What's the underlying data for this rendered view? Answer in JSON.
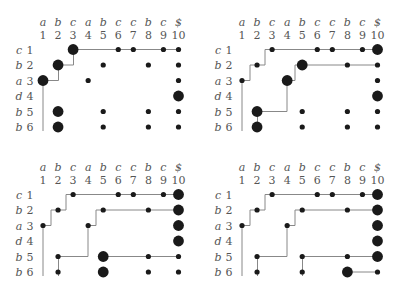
{
  "columns": {
    "letters": [
      "a",
      "b",
      "c",
      "a",
      "b",
      "c",
      "c",
      "b",
      "c",
      "$"
    ],
    "numbers": [
      "1",
      "2",
      "3",
      "4",
      "5",
      "6",
      "7",
      "8",
      "9",
      "10"
    ]
  },
  "rows": {
    "letters": [
      "c",
      "b",
      "a",
      "d",
      "b",
      "b"
    ],
    "numbers": [
      "1",
      "2",
      "3",
      "4",
      "5",
      "6"
    ]
  },
  "panels": [
    {
      "id": "top-left",
      "origin": [
        0,
        0
      ],
      "small_dots": [
        [
          1,
          6
        ],
        [
          1,
          7
        ],
        [
          1,
          9
        ],
        [
          1,
          10
        ],
        [
          2,
          5
        ],
        [
          2,
          8
        ],
        [
          2,
          10
        ],
        [
          3,
          4
        ],
        [
          3,
          10
        ],
        [
          5,
          5
        ],
        [
          5,
          8
        ],
        [
          5,
          10
        ],
        [
          6,
          5
        ],
        [
          6,
          8
        ],
        [
          6,
          10
        ]
      ],
      "large_dots": [
        [
          1,
          3
        ],
        [
          2,
          2
        ],
        [
          3,
          1
        ],
        [
          4,
          10
        ],
        [
          5,
          2
        ],
        [
          6,
          2
        ]
      ],
      "paths": [
        [
          [
            6.3,
            1
          ],
          [
            3,
            1
          ],
          [
            3,
            1.5
          ],
          [
            2.5,
            1.5
          ],
          [
            2.5,
            2
          ],
          [
            2,
            2
          ],
          [
            2,
            2.5
          ],
          [
            1.5,
            2.5
          ],
          [
            1.5,
            3
          ],
          [
            1,
            3
          ]
        ],
        [
          [
            1,
            3
          ],
          [
            1,
            10
          ]
        ]
      ]
    },
    {
      "id": "top-right",
      "origin": [
        199,
        0
      ],
      "small_dots": [
        [
          1,
          3
        ],
        [
          1,
          6
        ],
        [
          1,
          7
        ],
        [
          1,
          9
        ],
        [
          2,
          2
        ],
        [
          2,
          8
        ],
        [
          2,
          10
        ],
        [
          3,
          1
        ],
        [
          3,
          10
        ],
        [
          5,
          5
        ],
        [
          5,
          8
        ],
        [
          5,
          10
        ],
        [
          6,
          5
        ],
        [
          6,
          8
        ],
        [
          6,
          10
        ]
      ],
      "large_dots": [
        [
          1,
          10
        ],
        [
          2,
          5
        ],
        [
          3,
          4
        ],
        [
          4,
          10
        ],
        [
          5,
          2
        ],
        [
          6,
          2
        ]
      ],
      "paths": [
        [
          [
            6.3,
            1
          ],
          [
            3,
            1
          ],
          [
            3,
            1.5
          ],
          [
            2.5,
            1.5
          ],
          [
            2.5,
            2
          ],
          [
            2,
            2
          ],
          [
            2,
            2.5
          ],
          [
            1.5,
            2.5
          ],
          [
            1.5,
            3
          ],
          [
            1,
            3
          ]
        ],
        [
          [
            1,
            3
          ],
          [
            1,
            10
          ]
        ],
        [
          [
            2,
            10
          ],
          [
            2,
            5
          ],
          [
            2.5,
            5
          ],
          [
            2.5,
            4.5
          ],
          [
            3,
            4.5
          ],
          [
            3,
            4
          ],
          [
            3,
            4
          ],
          [
            5,
            4
          ],
          [
            5,
            2
          ]
        ],
        [
          [
            5,
            2
          ],
          [
            6,
            2
          ]
        ]
      ]
    },
    {
      "id": "bottom-left",
      "origin": [
        0,
        145
      ],
      "small_dots": [
        [
          1,
          3
        ],
        [
          1,
          6
        ],
        [
          1,
          7
        ],
        [
          1,
          9
        ],
        [
          2,
          2
        ],
        [
          2,
          5
        ],
        [
          2,
          8
        ],
        [
          3,
          1
        ],
        [
          3,
          4
        ],
        [
          5,
          2
        ],
        [
          5,
          8
        ],
        [
          5,
          10
        ],
        [
          6,
          2
        ],
        [
          6,
          8
        ],
        [
          6,
          10
        ]
      ],
      "large_dots": [
        [
          1,
          10
        ],
        [
          2,
          10
        ],
        [
          3,
          10
        ],
        [
          4,
          10
        ],
        [
          5,
          5
        ],
        [
          6,
          5
        ]
      ],
      "paths": [
        [
          [
            1,
            10
          ],
          [
            1,
            3
          ],
          [
            1.5,
            3
          ],
          [
            1.5,
            2.5
          ],
          [
            2,
            2.5
          ],
          [
            2,
            2
          ],
          [
            2.5,
            2
          ],
          [
            2.5,
            1.5
          ],
          [
            3,
            1.5
          ],
          [
            3,
            1
          ]
        ],
        [
          [
            3,
            1
          ],
          [
            6.3,
            1
          ]
        ],
        [
          [
            2,
            10
          ],
          [
            2,
            5
          ],
          [
            2.5,
            5
          ],
          [
            2.5,
            4.5
          ],
          [
            3,
            4.5
          ],
          [
            3,
            4
          ],
          [
            5,
            4
          ],
          [
            5,
            2
          ]
        ],
        [
          [
            5,
            2
          ],
          [
            6.3,
            2
          ]
        ],
        [
          [
            5,
            10
          ],
          [
            5,
            5
          ]
        ]
      ]
    },
    {
      "id": "bottom-right",
      "origin": [
        199,
        145
      ],
      "small_dots": [
        [
          1,
          3
        ],
        [
          1,
          6
        ],
        [
          1,
          7
        ],
        [
          1,
          9
        ],
        [
          2,
          2
        ],
        [
          2,
          5
        ],
        [
          2,
          8
        ],
        [
          3,
          1
        ],
        [
          3,
          4
        ],
        [
          5,
          2
        ],
        [
          5,
          5
        ],
        [
          5,
          8
        ],
        [
          6,
          2
        ],
        [
          6,
          5
        ],
        [
          6,
          10
        ]
      ],
      "large_dots": [
        [
          1,
          10
        ],
        [
          2,
          10
        ],
        [
          3,
          10
        ],
        [
          4,
          10
        ],
        [
          5,
          10
        ],
        [
          6,
          8
        ]
      ],
      "paths": [
        [
          [
            1,
            10
          ],
          [
            1,
            3
          ],
          [
            1.5,
            3
          ],
          [
            1.5,
            2.5
          ],
          [
            2,
            2.5
          ],
          [
            2,
            2
          ],
          [
            2.5,
            2
          ],
          [
            2.5,
            1.5
          ],
          [
            3,
            1.5
          ],
          [
            3,
            1
          ]
        ],
        [
          [
            3,
            1
          ],
          [
            6.3,
            1
          ]
        ],
        [
          [
            2,
            10
          ],
          [
            2,
            5
          ],
          [
            2.5,
            5
          ],
          [
            2.5,
            4.5
          ],
          [
            3,
            4.5
          ],
          [
            3,
            4
          ],
          [
            5,
            4
          ],
          [
            5,
            2
          ]
        ],
        [
          [
            5,
            2
          ],
          [
            6.3,
            2
          ]
        ],
        [
          [
            5,
            10
          ],
          [
            5,
            5
          ]
        ],
        [
          [
            5,
            2
          ],
          [
            6.3,
            2
          ]
        ]
      ]
    }
  ]
}
